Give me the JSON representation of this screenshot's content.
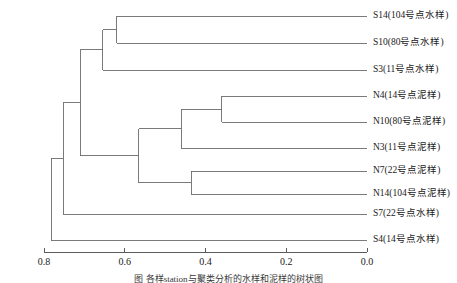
{
  "figure": {
    "caption": "图        各样station与聚类分析的水样和泥样的树状图",
    "axis_label": ""
  },
  "chart_data": {
    "type": "dendrogram",
    "title": "",
    "xlabel": "",
    "ylabel": "",
    "orientation": "horizontal",
    "axis_reversed": true,
    "xlim": [
      0.8,
      0.0
    ],
    "ticks": [
      "0.8",
      "0.6",
      "0.4",
      "0.2",
      "0.0"
    ],
    "tick_values": [
      0.8,
      0.6,
      0.4,
      0.2,
      0.0
    ],
    "grid": false,
    "legend": "none",
    "leaves": [
      {
        "id": "S14",
        "label": "S14(104号点水样)",
        "y": 16
      },
      {
        "id": "S10",
        "label": "S10(80号点水样)",
        "y": 43
      },
      {
        "id": "S3",
        "label": "S3(11号点水样)",
        "y": 70
      },
      {
        "id": "N4",
        "label": "N4(14号点泥样)",
        "y": 96
      },
      {
        "id": "N10",
        "label": "N10(80号点泥样)",
        "y": 122
      },
      {
        "id": "N3",
        "label": "N3(11号点泥样)",
        "y": 148
      },
      {
        "id": "N7",
        "label": "N7(22号点泥样)",
        "y": 171
      },
      {
        "id": "N14",
        "label": "N14(104号点泥样)",
        "y": 194
      },
      {
        "id": "S7",
        "label": "S7(22号点水样)",
        "y": 214
      },
      {
        "id": "S4",
        "label": "S4(14号点水样)",
        "y": 240
      }
    ],
    "merges": [
      {
        "name": "S14+S10",
        "height": 0.62,
        "members": [
          "S14",
          "S10"
        ]
      },
      {
        "name": "(S14,S10)+S3",
        "height": 0.655,
        "members": [
          "S14",
          "S10",
          "S3"
        ]
      },
      {
        "name": "N4+N10",
        "height": 0.36,
        "members": [
          "N4",
          "N10"
        ]
      },
      {
        "name": "(N4,N10)+N3",
        "height": 0.46,
        "members": [
          "N4",
          "N10",
          "N3"
        ]
      },
      {
        "name": "N7+N14",
        "height": 0.435,
        "members": [
          "N7",
          "N14"
        ]
      },
      {
        "name": "nitro-cluster",
        "height": 0.565,
        "members": [
          "N4",
          "N10",
          "N3",
          "N7",
          "N14"
        ]
      },
      {
        "name": "upper-join",
        "height": 0.71,
        "members": [
          "S14",
          "S10",
          "S3",
          "N4",
          "N10",
          "N3",
          "N7",
          "N14"
        ]
      },
      {
        "name": "plus-S7",
        "height": 0.752,
        "members": [
          "S14",
          "S10",
          "S3",
          "N4",
          "N10",
          "N3",
          "N7",
          "N14",
          "S7"
        ]
      },
      {
        "name": "root",
        "height": 0.782,
        "members": [
          "S14",
          "S10",
          "S3",
          "N4",
          "N10",
          "N3",
          "N7",
          "N14",
          "S7",
          "S4"
        ]
      }
    ]
  },
  "colors": {
    "line": "#6b6b6b",
    "text": "#1a1a1a",
    "background": "#ffffff"
  }
}
